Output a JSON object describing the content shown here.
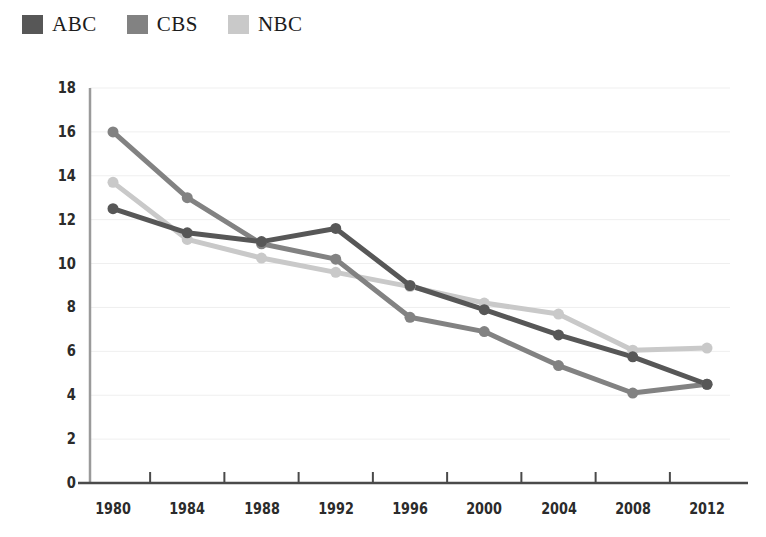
{
  "legend": {
    "position": "top-left",
    "items": [
      {
        "label": "ABC",
        "color": "#575757",
        "swatch_name": "legend-swatch-abc"
      },
      {
        "label": "CBS",
        "color": "#828282",
        "swatch_name": "legend-swatch-cbs"
      },
      {
        "label": "NBC",
        "color": "#c9c9c9",
        "swatch_name": "legend-swatch-nbc"
      }
    ]
  },
  "chart_data": {
    "type": "line",
    "title": "",
    "subtitle": "",
    "xlabel": "",
    "ylabel": "",
    "categories": [
      "1980",
      "1984",
      "1988",
      "1992",
      "1996",
      "2000",
      "2004",
      "2008",
      "2012"
    ],
    "x": [
      1980,
      1984,
      1988,
      1992,
      1996,
      2000,
      2004,
      2008,
      2012
    ],
    "series": [
      {
        "name": "ABC",
        "color": "#575757",
        "values": [
          12.5,
          11.4,
          11.0,
          11.6,
          9.0,
          7.9,
          6.75,
          5.75,
          4.5
        ]
      },
      {
        "name": "CBS",
        "color": "#828282",
        "values": [
          16.0,
          13.0,
          10.9,
          10.2,
          7.55,
          6.9,
          5.35,
          4.1,
          4.5
        ]
      },
      {
        "name": "NBC",
        "color": "#c9c9c9",
        "values": [
          13.7,
          11.1,
          10.25,
          9.6,
          8.95,
          8.2,
          7.7,
          6.05,
          6.15
        ]
      }
    ],
    "ylim": [
      0,
      18
    ],
    "yticks": [
      0,
      2,
      4,
      6,
      8,
      10,
      12,
      14,
      16,
      18
    ],
    "ytick_labels": [
      "0",
      "2",
      "4",
      "6",
      "8",
      "10",
      "12",
      "14",
      "16",
      "18"
    ],
    "xtick_labels": [
      "1980",
      "1984",
      "1988",
      "1992",
      "1996",
      "2000",
      "2004",
      "2008",
      "2012"
    ],
    "grid": {
      "horizontal": true,
      "vertical": false,
      "color": "#efefef"
    },
    "legend_position": "top-left",
    "markers": "circle",
    "marker_size": 11,
    "line_width": 5,
    "background": "#ffffff"
  }
}
